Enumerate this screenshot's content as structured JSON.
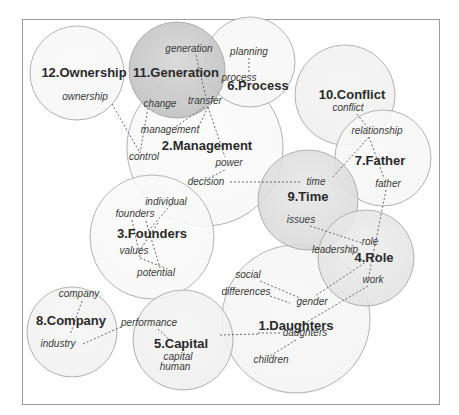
{
  "diagram": {
    "type": "keyword-cluster-map",
    "clusters": [
      {
        "id": 1,
        "label": "1.Daughters",
        "cx": 296,
        "cy": 319,
        "r": 74,
        "fill": "#f3f3f3",
        "lx": 296,
        "ly": 330
      },
      {
        "id": 2,
        "label": "2.Management",
        "cx": 205,
        "cy": 148,
        "r": 78,
        "fill": "#f8f8f8",
        "lx": 207,
        "ly": 150
      },
      {
        "id": 3,
        "label": "3.Founders",
        "cx": 152,
        "cy": 237,
        "r": 62,
        "fill": "#f8f8f8",
        "lx": 152,
        "ly": 238
      },
      {
        "id": 4,
        "label": "4.Role",
        "cx": 366,
        "cy": 258,
        "r": 48,
        "fill": "#e2e2e2",
        "lx": 374,
        "ly": 262
      },
      {
        "id": 5,
        "label": "5.Capital",
        "cx": 183,
        "cy": 340,
        "r": 50,
        "fill": "#efefef",
        "lx": 181,
        "ly": 348
      },
      {
        "id": 6,
        "label": "6.Process",
        "cx": 250,
        "cy": 62,
        "r": 45,
        "fill": "#f6f6f6",
        "lx": 258,
        "ly": 90
      },
      {
        "id": 7,
        "label": "7.Father",
        "cx": 383,
        "cy": 158,
        "r": 48,
        "fill": "#f6f6f6",
        "lx": 380,
        "ly": 165
      },
      {
        "id": 8,
        "label": "8.Company",
        "cx": 72,
        "cy": 332,
        "r": 45,
        "fill": "#f1f1f1",
        "lx": 71,
        "ly": 325
      },
      {
        "id": 9,
        "label": "9.Time",
        "cx": 308,
        "cy": 200,
        "r": 50,
        "fill": "#d8d8d8",
        "lx": 308,
        "ly": 201
      },
      {
        "id": 10,
        "label": "10.Conflict",
        "cx": 345,
        "cy": 95,
        "r": 50,
        "fill": "#eeeeee",
        "lx": 352,
        "ly": 99
      },
      {
        "id": 11,
        "label": "11.Generation",
        "cx": 177,
        "cy": 70,
        "r": 48,
        "fill": "#bdbdbd",
        "lx": 176,
        "ly": 77
      },
      {
        "id": 12,
        "label": "12.Ownership",
        "cx": 77,
        "cy": 73,
        "r": 47,
        "fill": "#f7f7f7",
        "lx": 84,
        "ly": 77
      }
    ],
    "terms": [
      {
        "text": "ownership",
        "x": 85,
        "y": 100
      },
      {
        "text": "generation",
        "x": 189,
        "y": 52
      },
      {
        "text": "change",
        "x": 160,
        "y": 107
      },
      {
        "text": "transfer",
        "x": 205,
        "y": 104
      },
      {
        "text": "planning",
        "x": 249,
        "y": 55
      },
      {
        "text": "process",
        "x": 239,
        "y": 81
      },
      {
        "text": "management",
        "x": 170,
        "y": 133
      },
      {
        "text": "control",
        "x": 144,
        "y": 160
      },
      {
        "text": "power",
        "x": 229,
        "y": 166
      },
      {
        "text": "decision",
        "x": 206,
        "y": 185
      },
      {
        "text": "conflict",
        "x": 348,
        "y": 111
      },
      {
        "text": "relationship",
        "x": 377,
        "y": 134
      },
      {
        "text": "father",
        "x": 388,
        "y": 187
      },
      {
        "text": "time",
        "x": 316,
        "y": 185
      },
      {
        "text": "issues",
        "x": 301,
        "y": 223
      },
      {
        "text": "individual",
        "x": 166,
        "y": 205
      },
      {
        "text": "founders",
        "x": 135,
        "y": 217
      },
      {
        "text": "values",
        "x": 134,
        "y": 254
      },
      {
        "text": "potential",
        "x": 156,
        "y": 276
      },
      {
        "text": "role",
        "x": 370,
        "y": 245
      },
      {
        "text": "leadership",
        "x": 335,
        "y": 253
      },
      {
        "text": "work",
        "x": 373,
        "y": 283
      },
      {
        "text": "social",
        "x": 248,
        "y": 278
      },
      {
        "text": "differences",
        "x": 246,
        "y": 295
      },
      {
        "text": "gender",
        "x": 312,
        "y": 305
      },
      {
        "text": "daughters",
        "x": 305,
        "y": 336
      },
      {
        "text": "children",
        "x": 271,
        "y": 363
      },
      {
        "text": "company",
        "x": 79,
        "y": 297
      },
      {
        "text": "performance",
        "x": 149,
        "y": 326
      },
      {
        "text": "industry",
        "x": 58,
        "y": 347
      },
      {
        "text": "capital",
        "x": 178,
        "y": 360
      },
      {
        "text": "human",
        "x": 175,
        "y": 370
      }
    ],
    "links": [
      [
        112,
        104,
        140,
        153
      ],
      [
        148,
        108,
        140,
        153
      ],
      [
        196,
        55,
        206,
        98
      ],
      [
        204,
        107,
        174,
        128
      ],
      [
        208,
        107,
        198,
        128
      ],
      [
        208,
        107,
        225,
        157
      ],
      [
        249,
        58,
        249,
        74
      ],
      [
        205,
        180,
        225,
        170
      ],
      [
        230,
        182,
        300,
        182
      ],
      [
        357,
        114,
        368,
        128
      ],
      [
        369,
        137,
        332,
        178
      ],
      [
        369,
        137,
        384,
        178
      ],
      [
        386,
        190,
        368,
        280
      ],
      [
        310,
        226,
        362,
        243
      ],
      [
        355,
        247,
        348,
        250
      ],
      [
        378,
        254,
        315,
        296
      ],
      [
        368,
        286,
        300,
        326
      ],
      [
        260,
        281,
        300,
        298
      ],
      [
        270,
        296,
        290,
        303
      ],
      [
        258,
        333,
        280,
        333
      ],
      [
        296,
        340,
        270,
        356
      ],
      [
        220,
        335,
        260,
        334
      ],
      [
        173,
        202,
        145,
        235
      ],
      [
        132,
        220,
        140,
        257
      ],
      [
        146,
        221,
        160,
        268
      ],
      [
        158,
        223,
        140,
        250
      ],
      [
        140,
        258,
        165,
        268
      ],
      [
        82,
        301,
        70,
        335
      ],
      [
        83,
        344,
        121,
        327
      ],
      [
        158,
        329,
        170,
        340
      ]
    ]
  }
}
